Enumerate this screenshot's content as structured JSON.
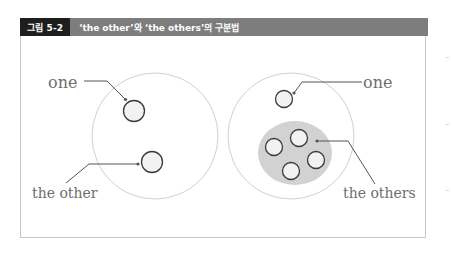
{
  "header": {
    "figure_label": "그림 5-2",
    "title": "‘the other’와 ‘the others’의 구분법"
  },
  "colors": {
    "label_bg": "#1e1e1e",
    "title_bar_bg": "#7d7d7d",
    "header_text": "#ffffff",
    "big_circle_stroke": "#cfcfcf",
    "small_circle_stroke": "#3a3a3a",
    "small_circle_fill": "#f2f2f2",
    "group_fill": "#d2d2d2",
    "leader_line": "#555555",
    "label_text": "#6e6e6e"
  },
  "left_panel": {
    "label_one": "one",
    "label_the_other": "the other"
  },
  "right_panel": {
    "label_one": "one",
    "label_the_others": "the others"
  }
}
